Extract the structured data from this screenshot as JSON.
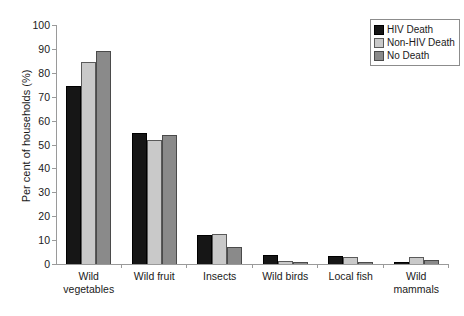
{
  "chart_data": {
    "type": "bar",
    "title": "",
    "xlabel": "",
    "ylabel": "Per cent of households (%)",
    "ylim": [
      0,
      100
    ],
    "ytick_step": 10,
    "yticks": [
      100,
      90,
      80,
      70,
      60,
      50,
      40,
      30,
      20,
      10,
      0
    ],
    "grid": false,
    "legend_position": "top-right",
    "categories": [
      "Wild vegetables",
      "Wild fruit",
      "Insects",
      "Wild birds",
      "Local fish",
      "Wild mammals"
    ],
    "category_lines": [
      [
        "Wild",
        "vegetables"
      ],
      [
        "Wild fruit",
        ""
      ],
      [
        "Insects",
        ""
      ],
      [
        "Wild birds",
        ""
      ],
      [
        "Local fish",
        ""
      ],
      [
        "Wild",
        "mammals"
      ]
    ],
    "series": [
      {
        "name": "HIV Death",
        "color": "#161616",
        "values": [
          74.5,
          55.0,
          12.0,
          3.7,
          3.5,
          0.7
        ]
      },
      {
        "name": "Non-HIV Death",
        "color": "#c9c9c9",
        "values": [
          84.5,
          52.0,
          12.6,
          1.3,
          2.9,
          2.8
        ]
      },
      {
        "name": "No Death",
        "color": "#8a8a8a",
        "values": [
          89.2,
          54.0,
          7.2,
          0.9,
          0.9,
          1.8
        ]
      }
    ]
  }
}
